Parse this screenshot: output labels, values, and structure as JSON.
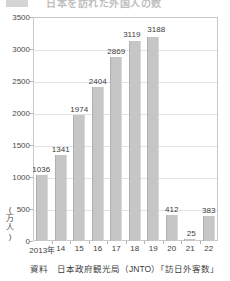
{
  "header": {
    "title_partial": "日本を訪れた外国人の数",
    "legend_swatch_color": "#9f9f9f"
  },
  "chart_data": {
    "type": "bar",
    "title": "日本を訪れた外国人の数",
    "xlabel": "",
    "ylabel": "(万人)",
    "yunit_chars": [
      "(",
      "万",
      "人",
      ")"
    ],
    "categories": [
      "2013年",
      "14",
      "15",
      "16",
      "17",
      "18",
      "19",
      "20",
      "21",
      "22"
    ],
    "values": [
      1036,
      1341,
      1974,
      2404,
      2869,
      3119,
      3188,
      412,
      25,
      383
    ],
    "value_labels": [
      "1036",
      "1341",
      "1974",
      "2404",
      "2869",
      "3119",
      "3188",
      "412",
      "25",
      "383"
    ],
    "yticks": [
      0,
      500,
      1000,
      1500,
      2000,
      2500,
      3000,
      3500
    ],
    "ytick_labels": [
      "0",
      "500",
      "1000",
      "1500",
      "2000",
      "2500",
      "3000",
      "3500"
    ],
    "ylim": [
      0,
      3500
    ],
    "grid": true,
    "legend": "none",
    "bar_color": "#c6c6c6",
    "gridline_color": "#e2e2e2",
    "frame_color": "#c9c9c9"
  },
  "footer": {
    "source_label": "資料",
    "source_text": "日本政府観光局（JNTO）「訪日外客数」",
    "source_full": "資料　日本政府観光局（JNTO）「訪日外客数」"
  }
}
